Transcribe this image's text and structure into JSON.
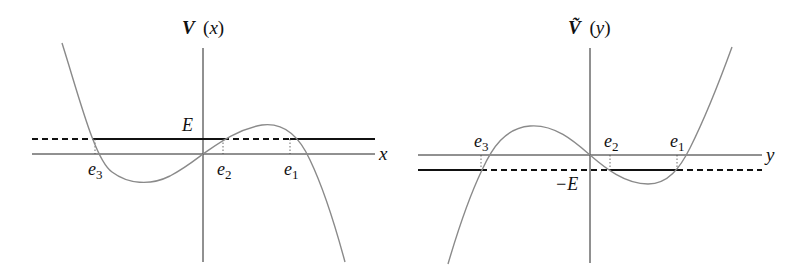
{
  "left_plot": {
    "title_main": "V",
    "title_arg": "(x)",
    "axis_label": "x",
    "level_label": "E",
    "roots": [
      {
        "name": "e",
        "sub": "3"
      },
      {
        "name": "e",
        "sub": "2"
      },
      {
        "name": "e",
        "sub": "1"
      }
    ]
  },
  "right_plot": {
    "title_main": "Ṽ",
    "title_arg": "(y)",
    "axis_label": "y",
    "level_label": "−E",
    "roots": [
      {
        "name": "e",
        "sub": "3"
      },
      {
        "name": "e",
        "sub": "2"
      },
      {
        "name": "e",
        "sub": "1"
      }
    ]
  },
  "colors": {
    "curve": "#8a8a8a",
    "axes": "#222222",
    "level_line": "#111111"
  }
}
